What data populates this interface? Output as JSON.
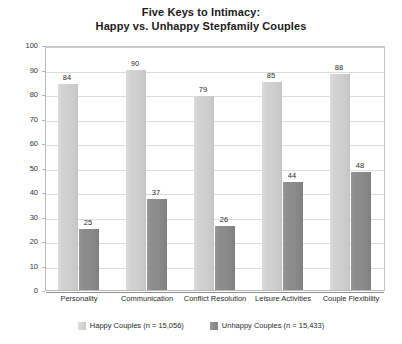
{
  "chart_data": {
    "type": "bar",
    "title": "Five Keys to Intimacy:\nHappy vs. Unhappy Stepfamily Couples",
    "title_line1": "Five Keys to Intimacy:",
    "title_line2": "Happy vs. Unhappy Stepfamily Couples",
    "xlabel": "",
    "ylabel": "",
    "ylim": [
      0,
      100
    ],
    "ytick_step": 10,
    "yticks": [
      100,
      90,
      80,
      70,
      60,
      50,
      40,
      30,
      20,
      10,
      0
    ],
    "ytick_labels": [
      "100",
      "90",
      "80",
      "70",
      "60",
      "50",
      "40",
      "30",
      "20",
      "10",
      "0"
    ],
    "grid": true,
    "legend_position": "bottom-center",
    "categories": [
      "Personality",
      "Communication",
      "Conflict Resolution",
      "Leisure Activities",
      "Couple Flexibility"
    ],
    "series": [
      {
        "name": "Happy Couples (n = 15,056)",
        "short_name": "Happy Couples",
        "n": "15,056",
        "color": "#d0d0d0",
        "values": [
          84,
          90,
          79,
          85,
          88
        ],
        "value_labels": [
          "84",
          "90",
          "79",
          "85",
          "88"
        ]
      },
      {
        "name": "Unhappy Couples (n = 15,433)",
        "short_name": "Unhappy Couples",
        "n": "15,433",
        "color": "#8a8a8a",
        "values": [
          25,
          37,
          26,
          44,
          48
        ],
        "value_labels": [
          "25",
          "37",
          "26",
          "44",
          "48"
        ]
      }
    ]
  },
  "legend": {
    "items": [
      {
        "label": "Happy Couples (n = 15,056)",
        "swatch": "happy"
      },
      {
        "label": "Unhappy Couples (n = 15,433)",
        "swatch": "unhappy"
      }
    ]
  }
}
